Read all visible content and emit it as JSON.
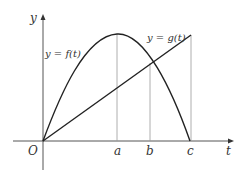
{
  "diagram": {
    "axes": {
      "x_label": "t",
      "y_label": "y",
      "origin_label": "O"
    },
    "curves": {
      "f_label": "y = f(t)",
      "g_label": "y = g(t)"
    },
    "ticks": {
      "a": "a",
      "b": "b",
      "c": "c"
    },
    "colors": {
      "curve": "#222222",
      "axis": "#555555",
      "guide": "#999999",
      "background": "#ffffff"
    }
  }
}
